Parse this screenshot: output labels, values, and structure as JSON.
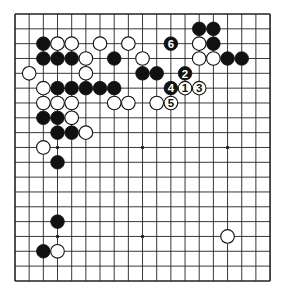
{
  "board": {
    "size": 19,
    "origin_x": 15,
    "origin_y": 14,
    "spacing_x": 14.17,
    "spacing_y": 14.83,
    "stone_radius": 6.8,
    "line_color": "#222222",
    "black_color": "#111111",
    "white_color": "#ffffff",
    "hoshi": [
      [
        3,
        3
      ],
      [
        9,
        3
      ],
      [
        15,
        3
      ],
      [
        3,
        9
      ],
      [
        9,
        9
      ],
      [
        15,
        9
      ],
      [
        3,
        15
      ],
      [
        9,
        15
      ],
      [
        15,
        15
      ]
    ]
  },
  "stones": {
    "black": [
      [
        2,
        2
      ],
      [
        2,
        3
      ],
      [
        3,
        3
      ],
      [
        4,
        3
      ],
      [
        7,
        3
      ],
      [
        9,
        4
      ],
      [
        10,
        4
      ],
      [
        3,
        5
      ],
      [
        4,
        5
      ],
      [
        5,
        5
      ],
      [
        6,
        5
      ],
      [
        7,
        5
      ],
      [
        2,
        7
      ],
      [
        3,
        7
      ],
      [
        3,
        8
      ],
      [
        4,
        8
      ],
      [
        3,
        10
      ],
      [
        3,
        14
      ],
      [
        2,
        16
      ],
      [
        13,
        1
      ],
      [
        14,
        1
      ],
      [
        14,
        2
      ],
      [
        15,
        3
      ],
      [
        16,
        3
      ]
    ],
    "white": [
      [
        3,
        2
      ],
      [
        4,
        2
      ],
      [
        6,
        2
      ],
      [
        8,
        2
      ],
      [
        5,
        3
      ],
      [
        9,
        3
      ],
      [
        1,
        4
      ],
      [
        5,
        4
      ],
      [
        2,
        5
      ],
      [
        2,
        6
      ],
      [
        3,
        6
      ],
      [
        4,
        6
      ],
      [
        7,
        6
      ],
      [
        8,
        6
      ],
      [
        10,
        6
      ],
      [
        4,
        7
      ],
      [
        5,
        8
      ],
      [
        2,
        9
      ],
      [
        3,
        16
      ],
      [
        13,
        2
      ],
      [
        13,
        3
      ],
      [
        14,
        3
      ],
      [
        15,
        15
      ]
    ]
  },
  "moves": [
    {
      "number": "1",
      "color": "white",
      "col": 12,
      "row": 5
    },
    {
      "number": "2",
      "color": "black",
      "col": 12,
      "row": 4
    },
    {
      "number": "3",
      "color": "white",
      "col": 13,
      "row": 5
    },
    {
      "number": "4",
      "color": "black",
      "col": 11,
      "row": 5
    },
    {
      "number": "5",
      "color": "white",
      "col": 11,
      "row": 6
    },
    {
      "number": "6",
      "color": "black",
      "col": 11,
      "row": 2
    }
  ]
}
